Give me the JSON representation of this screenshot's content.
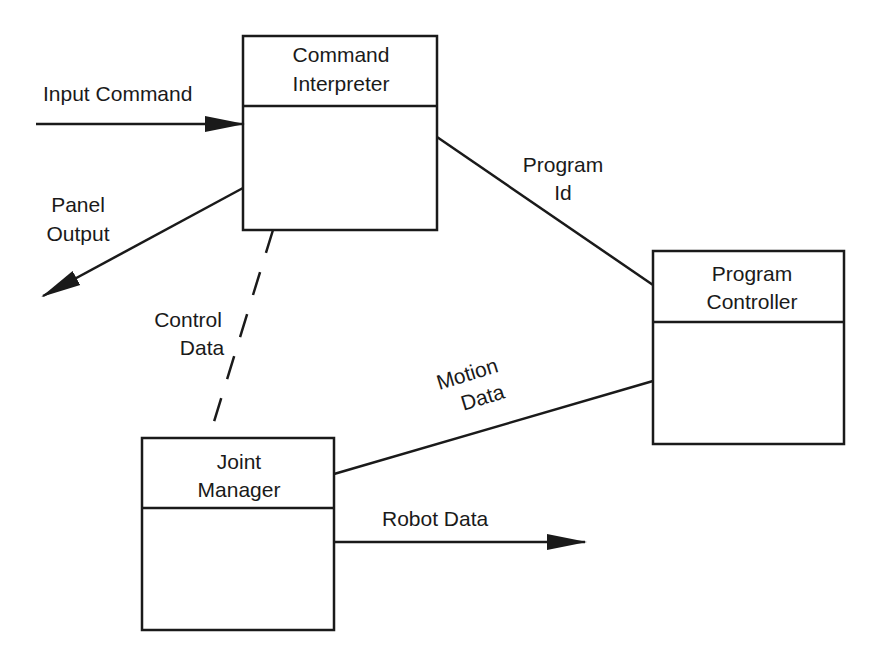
{
  "diagram": {
    "type": "object-interaction-diagram",
    "nodes": [
      {
        "id": "command-interpreter",
        "title_lines": [
          "Command",
          "Interpreter"
        ]
      },
      {
        "id": "program-controller",
        "title_lines": [
          "Program",
          "Controller"
        ]
      },
      {
        "id": "joint-manager",
        "title_lines": [
          "Joint",
          "Manager"
        ]
      }
    ],
    "edges": [
      {
        "id": "input-command",
        "label_lines": [
          "Input Command"
        ],
        "from": null,
        "to": "command-interpreter",
        "style": "solid",
        "arrow": true
      },
      {
        "id": "panel-output",
        "label_lines": [
          "Panel",
          "Output"
        ],
        "from": "command-interpreter",
        "to": null,
        "style": "solid",
        "arrow": true
      },
      {
        "id": "program-id",
        "label_lines": [
          "Program",
          "Id"
        ],
        "from": "command-interpreter",
        "to": "program-controller",
        "style": "solid",
        "arrow": false
      },
      {
        "id": "control-data",
        "label_lines": [
          "Control",
          "Data"
        ],
        "from": "command-interpreter",
        "to": "joint-manager",
        "style": "dashed",
        "arrow": false
      },
      {
        "id": "motion-data",
        "label_lines": [
          "Motion",
          "Data"
        ],
        "from": "program-controller",
        "to": "joint-manager",
        "style": "solid",
        "arrow": false
      },
      {
        "id": "robot-data",
        "label_lines": [
          "Robot Data"
        ],
        "from": "joint-manager",
        "to": null,
        "style": "solid",
        "arrow": true
      }
    ]
  },
  "colors": {
    "stroke": "#1a1a1a",
    "background": "#ffffff"
  }
}
